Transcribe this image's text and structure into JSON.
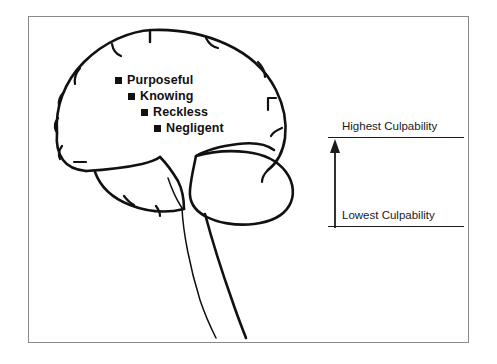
{
  "figure": {
    "type": "lateral-brain-culpability-diagram",
    "background_color": "#ffffff",
    "frame_color": "#8a8a8a",
    "ink_color": "#111111"
  },
  "culpability_levels": {
    "items": [
      {
        "label": "Purposeful",
        "level": 1,
        "indent": 0
      },
      {
        "label": "Knowing",
        "level": 2,
        "indent": 1
      },
      {
        "label": "Reckless",
        "level": 3,
        "indent": 2
      },
      {
        "label": "Negligent",
        "level": 4,
        "indent": 3
      }
    ]
  },
  "scale": {
    "top_caption": "Highest Culpability",
    "bottom_caption": "Lowest Culpability",
    "arrow_direction": "up"
  }
}
